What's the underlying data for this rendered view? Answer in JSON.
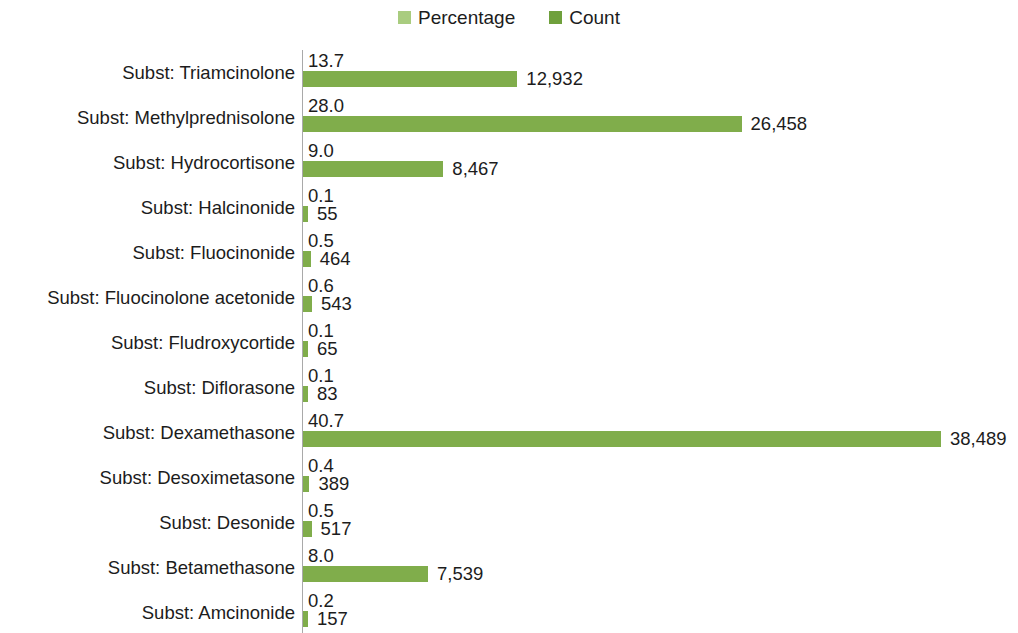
{
  "legend": {
    "position": "top-center",
    "entries": [
      {
        "label": "Percentage",
        "color": "#a9cc7f",
        "icon": "square-swatch-icon"
      },
      {
        "label": "Count",
        "color": "#6fa03c",
        "icon": "square-swatch-icon"
      }
    ]
  },
  "chart_data": {
    "type": "bar",
    "orientation": "horizontal",
    "title": "",
    "subtitle": "",
    "xlabel": "",
    "ylabel": "",
    "grid": false,
    "legend_position": "top-center",
    "bar_color": "#80ad4b",
    "axis_line_color": "#a9a9a9",
    "categories": [
      "Subst: Triamcinolone",
      "Subst: Methylprednisolone",
      "Subst: Hydrocortisone",
      "Subst: Halcinonide",
      "Subst: Fluocinonide",
      "Subst: Fluocinolone acetonide",
      "Subst: Fludroxycortide",
      "Subst: Diflorasone",
      "Subst: Dexamethasone",
      "Subst: Desoximetasone",
      "Subst: Desonide",
      "Subst: Betamethasone",
      "Subst: Amcinonide"
    ],
    "series": [
      {
        "name": "Percentage",
        "values": [
          13.7,
          28.0,
          9.0,
          0.1,
          0.5,
          0.6,
          0.1,
          0.1,
          40.7,
          0.4,
          0.5,
          8.0,
          0.2
        ],
        "labels": [
          "13.7",
          "28.0",
          "9.0",
          "0.1",
          "0.5",
          "0.6",
          "0.1",
          "0.1",
          "40.7",
          "0.4",
          "0.5",
          "8.0",
          "0.2"
        ]
      },
      {
        "name": "Count",
        "values": [
          12932,
          26458,
          8467,
          55,
          464,
          543,
          65,
          83,
          38489,
          389,
          517,
          7539,
          157
        ],
        "labels": [
          "12,932",
          "26,458",
          "8,467",
          "55",
          "464",
          "543",
          "65",
          "83",
          "38,489",
          "389",
          "517",
          "7,539",
          "157"
        ]
      }
    ],
    "xlim": [
      0,
      38489
    ],
    "max_count": 38489
  }
}
